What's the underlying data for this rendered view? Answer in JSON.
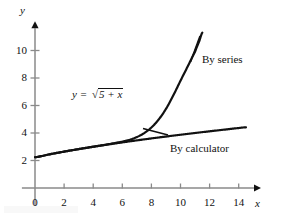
{
  "figure": {
    "background": "#ffffff",
    "ink": "#111111",
    "axis_color": "#8a8a8a"
  },
  "labels": {
    "y_axis_name": "y",
    "x_axis_name": "x",
    "equation_y": "y",
    "equation_eq": "=",
    "equation_radicand": "5 + x",
    "radical_sign": "√",
    "series_label": "By series",
    "calculator_label": "By calculator"
  },
  "chart_data": {
    "type": "line",
    "title": "",
    "xlabel": "x",
    "ylabel": "y",
    "xlim": [
      -0.9,
      15.4
    ],
    "ylim": [
      -1.35,
      11.9
    ],
    "grid": false,
    "legend": "inline-annotations",
    "x_ticks": [
      0,
      2,
      4,
      6,
      8,
      10,
      12,
      14
    ],
    "x_tick_labels": [
      "0",
      "2",
      "4",
      "6",
      "8",
      "10",
      "12",
      "14"
    ],
    "y_ticks": [
      2,
      4,
      6,
      8,
      10
    ],
    "y_tick_labels": [
      "2",
      "4",
      "6",
      "8",
      "10"
    ],
    "annotations": [
      {
        "text": "y = √(5 + x)",
        "x": 3.1,
        "y": 7.0
      },
      {
        "text": "By series",
        "x": 11.2,
        "y": 9.5
      },
      {
        "text": "By calculator",
        "x": 9.3,
        "y": 3.05
      }
    ],
    "series": [
      {
        "name": "By calculator",
        "note": "exact y = sqrt(5+x)",
        "x": [
          0,
          1,
          2,
          3,
          4,
          5,
          6,
          7,
          8,
          9,
          10,
          11,
          12,
          13,
          14,
          14.5
        ],
        "values": [
          2.236,
          2.449,
          2.646,
          2.828,
          3.0,
          3.162,
          3.317,
          3.464,
          3.606,
          3.742,
          3.873,
          4.0,
          4.123,
          4.243,
          4.359,
          4.416
        ]
      },
      {
        "name": "By series",
        "note": "truncated binomial series for sqrt(5+x); diverges for large x",
        "x": [
          0,
          1,
          2,
          3,
          4,
          5,
          6,
          6.5,
          7,
          7.5,
          8,
          8.5,
          9,
          9.5,
          10,
          10.5,
          11,
          11.3,
          11.5
        ],
        "values": [
          2.236,
          2.449,
          2.646,
          2.829,
          3.003,
          3.172,
          3.366,
          3.5,
          3.7,
          3.99,
          4.4,
          4.98,
          5.75,
          6.72,
          7.8,
          8.85,
          9.9,
          10.7,
          11.3
        ]
      }
    ]
  }
}
